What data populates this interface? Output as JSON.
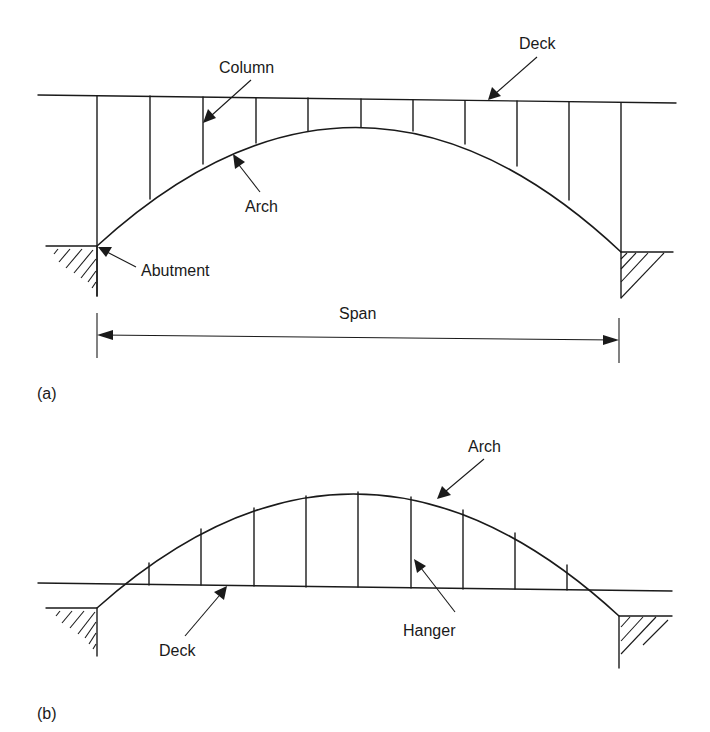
{
  "figure": {
    "panels": [
      {
        "id": "a",
        "caption": "(a)",
        "description": "Deck arch bridge: deck above the arch, carried by columns",
        "labels": {
          "deck": "Deck",
          "column": "Column",
          "arch": "Arch",
          "abutment": "Abutment",
          "span": "Span"
        },
        "column_count": 11
      },
      {
        "id": "b",
        "caption": "(b)",
        "description": "Through arch bridge: deck below the arch, suspended by hangers",
        "labels": {
          "arch": "Arch",
          "hanger": "Hanger",
          "deck": "Deck"
        },
        "hanger_count": 9
      }
    ]
  },
  "colors": {
    "ink": "#1a1a1a",
    "background": "#ffffff"
  }
}
